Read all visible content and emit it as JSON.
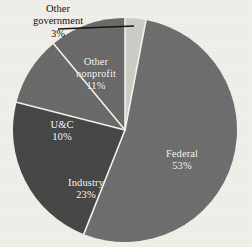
{
  "chart_data": {
    "type": "pie",
    "title": "",
    "subtitle": "",
    "xlabel": "",
    "ylabel": "",
    "legend_position": "none",
    "grid": false,
    "units": "percent",
    "total": 100,
    "start_angle_deg": 0,
    "direction": "clockwise",
    "categories": [
      "Other government",
      "Federal",
      "Industry",
      "U&C",
      "Other nonprofit"
    ],
    "values": [
      3,
      53,
      23,
      10,
      11
    ],
    "slices": [
      {
        "name": "Other government",
        "value": 3,
        "value_label": "3%",
        "color": "#cdccc6",
        "label_placement": "external",
        "label_text_color": "#16120f",
        "has_leader_line": true
      },
      {
        "name": "Federal",
        "value": 53,
        "value_label": "53%",
        "color": "#6e6e6e",
        "label_placement": "internal",
        "label_text_color": "#ffffff",
        "has_leader_line": false
      },
      {
        "name": "Industry",
        "value": 23,
        "value_label": "23%",
        "color": "#474747",
        "label_placement": "internal",
        "label_text_color": "#ffffff",
        "has_leader_line": false
      },
      {
        "name": "U&C",
        "value": 10,
        "value_label": "10%",
        "color": "#6a6a6a",
        "label_placement": "internal",
        "label_text_color": "#ffffff",
        "has_leader_line": false
      },
      {
        "name": "Other nonprofit",
        "value": 11,
        "value_label": "11%",
        "color": "#6a6a6a",
        "label_placement": "internal",
        "label_text_color": "#ffffff",
        "has_leader_line": false
      }
    ]
  },
  "labels": {
    "federal": {
      "name": "Federal",
      "value": "53%"
    },
    "industry": {
      "name": "Industry",
      "value": "23%"
    },
    "uc": {
      "name": "U&C",
      "value": "10%"
    },
    "nonprofit_line1": "Other",
    "nonprofit_line2": "nonprofit",
    "nonprofit_value": "11%",
    "othergov_line1": "Other",
    "othergov_line2": "government",
    "othergov_value": "3%"
  },
  "style": {
    "background": "#f1efe9",
    "divider_color": "#f4f2ec",
    "leader_line_color": "#19150f"
  }
}
